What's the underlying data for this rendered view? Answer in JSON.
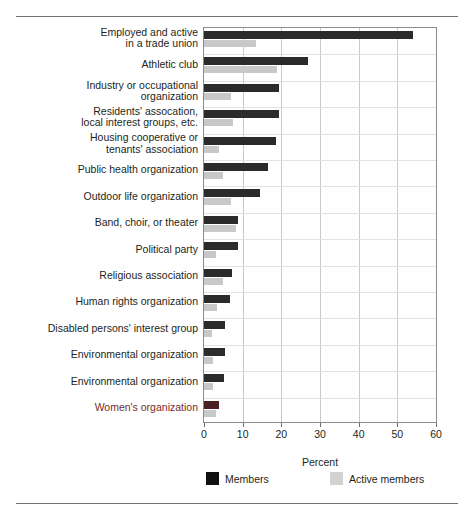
{
  "chart_data": {
    "type": "bar",
    "orientation": "horizontal",
    "title": "",
    "xlabel": "Percent",
    "ylabel": "",
    "xlim": [
      0,
      60
    ],
    "xticks": [
      0,
      10,
      20,
      30,
      40,
      50,
      60
    ],
    "grid": true,
    "legend_position": "bottom",
    "categories": [
      "Employed and active\nin a trade union",
      "Athletic club",
      "Industry or occupational\norganization",
      "Residents' assocation,\nlocal interest groups, etc.",
      "Housing cooperative or\ntenants' association",
      "Public health organization",
      "Outdoor life organization",
      "Band, choir, or theater",
      "Political party",
      "Religious association",
      "Human rights organization",
      "Disabled persons' interest group",
      "Environmental organization",
      "Environmental organization",
      "Women's organization"
    ],
    "series": [
      {
        "name": "Members",
        "color": "#2b2b2b",
        "values": [
          54,
          27,
          19.5,
          19.5,
          18.5,
          16.5,
          14.5,
          8.7,
          8.7,
          7.2,
          6.7,
          5.5,
          5.5,
          5.3,
          4
        ]
      },
      {
        "name": "Active members",
        "color": "#c8c8c8",
        "values": [
          13.5,
          19,
          7,
          7.5,
          4,
          5,
          7,
          8.2,
          3,
          5,
          3.3,
          2,
          2.3,
          2.3,
          3
        ]
      }
    ]
  },
  "legend": {
    "items": [
      {
        "label": "Members",
        "swatch": "members"
      },
      {
        "label": "Active members",
        "swatch": "active"
      }
    ]
  },
  "axis": {
    "title": "Percent",
    "ticks": [
      "0",
      "10",
      "20",
      "30",
      "40",
      "50",
      "60"
    ]
  },
  "accent_color": "#7a2b2b",
  "highlighted_category_index": 14
}
